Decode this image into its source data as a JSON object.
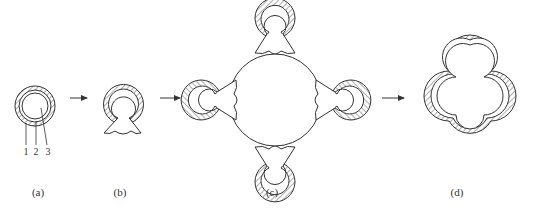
{
  "figure": {
    "panels": [
      {
        "id": "a",
        "label": "(a)",
        "description": "Single coated sphere with three layers"
      },
      {
        "id": "b",
        "label": "(b)",
        "description": "Coated sphere with shell ruptured, neck formed"
      },
      {
        "id": "c",
        "label": "(c)",
        "description": "Four ruptured spheres attached to a central sphere"
      },
      {
        "id": "d",
        "label": "(d)",
        "description": "Fused four-lobed coated structure"
      }
    ],
    "layer_labels": [
      "1",
      "2",
      "3"
    ],
    "arrows": 3,
    "colors": {
      "line": "#333333",
      "background": "#ffffff"
    }
  }
}
